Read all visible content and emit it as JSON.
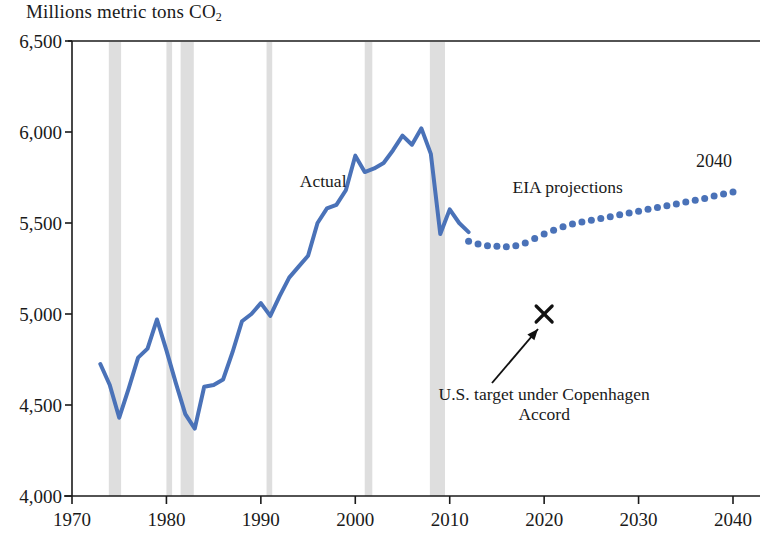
{
  "chart_data": {
    "type": "line",
    "title": "",
    "ylabel": "Millions metric tons CO2",
    "ylabel_main": "Millions metric tons CO",
    "ylabel_sub": "2",
    "xlabel": "",
    "xlim": [
      1970,
      2040
    ],
    "ylim": [
      4000,
      6500
    ],
    "yticks": [
      "4,000",
      "4,500",
      "5,000",
      "5,500",
      "6,000",
      "6,500"
    ],
    "ytick_values": [
      4000,
      4500,
      5000,
      5500,
      6000,
      6500
    ],
    "xticks": [
      "1970",
      "1980",
      "1990",
      "2000",
      "2010",
      "2020",
      "2030",
      "2040"
    ],
    "xtick_values": [
      1970,
      1980,
      1990,
      2000,
      2010,
      2020,
      2030,
      2040
    ],
    "grid": false,
    "legend": "none",
    "accent_color": "#4A72B8",
    "recession_band_color": "#c9c9c9",
    "axis_color": "#1a1a1a",
    "series": [
      {
        "name": "Actual",
        "style": "solid",
        "color": "#4A72B8",
        "x": [
          1973,
          1974,
          1975,
          1976,
          1977,
          1978,
          1979,
          1980,
          1981,
          1982,
          1983,
          1984,
          1985,
          1986,
          1987,
          1988,
          1989,
          1990,
          1991,
          1992,
          1993,
          1994,
          1995,
          1996,
          1997,
          1998,
          1999,
          2000,
          2001,
          2002,
          2003,
          2004,
          2005,
          2006,
          2007,
          2008,
          2009,
          2010,
          2011,
          2012
        ],
        "values": [
          4725,
          4610,
          4430,
          4590,
          4760,
          4810,
          4970,
          4800,
          4620,
          4450,
          4370,
          4600,
          4610,
          4640,
          4790,
          4960,
          5000,
          5060,
          4990,
          5100,
          5200,
          5260,
          5320,
          5500,
          5580,
          5600,
          5680,
          5870,
          5780,
          5800,
          5830,
          5900,
          5980,
          5930,
          6020,
          5880,
          5440,
          5575,
          5500,
          5450
        ]
      },
      {
        "name": "EIA projections",
        "style": "dotted",
        "color": "#4A72B8",
        "x": [
          2012,
          2013,
          2014,
          2015,
          2016,
          2017,
          2018,
          2019,
          2020,
          2021,
          2022,
          2023,
          2024,
          2025,
          2026,
          2027,
          2028,
          2029,
          2030,
          2031,
          2032,
          2033,
          2034,
          2035,
          2036,
          2037,
          2038,
          2039,
          2040
        ],
        "values": [
          5400,
          5385,
          5375,
          5372,
          5370,
          5375,
          5390,
          5415,
          5440,
          5460,
          5480,
          5495,
          5505,
          5515,
          5525,
          5535,
          5545,
          5555,
          5565,
          5575,
          5585,
          5595,
          5605,
          5615,
          5625,
          5635,
          5648,
          5660,
          5670
        ]
      }
    ],
    "markers": [
      {
        "name": "U.S. target under Copenhagen Accord",
        "symbol": "x",
        "x": 2020,
        "y": 5000,
        "color": "#111111"
      }
    ],
    "recession_bands": [
      {
        "start": 1973.9,
        "end": 1975.2
      },
      {
        "start": 1980.0,
        "end": 1980.6
      },
      {
        "start": 1981.5,
        "end": 1982.9
      },
      {
        "start": 1990.6,
        "end": 1991.2
      },
      {
        "start": 2001.0,
        "end": 2001.8
      },
      {
        "start": 2007.9,
        "end": 2009.5
      }
    ],
    "annotations": [
      {
        "name": "actual-label",
        "text": "Actual",
        "x": 1996.6,
        "y": 5730
      },
      {
        "name": "eia-label",
        "text": "EIA projections",
        "x": 2022.5,
        "y": 5700
      },
      {
        "name": "endpoint-year-label",
        "text": "2040",
        "x": 2038,
        "y": 5840
      },
      {
        "name": "copenhagen-label-line1",
        "text": "U.S. target under Copenhagen",
        "x": 2020,
        "y": 4560
      },
      {
        "name": "copenhagen-label-line2",
        "text": "Accord",
        "x": 2020,
        "y": 4450
      }
    ]
  }
}
